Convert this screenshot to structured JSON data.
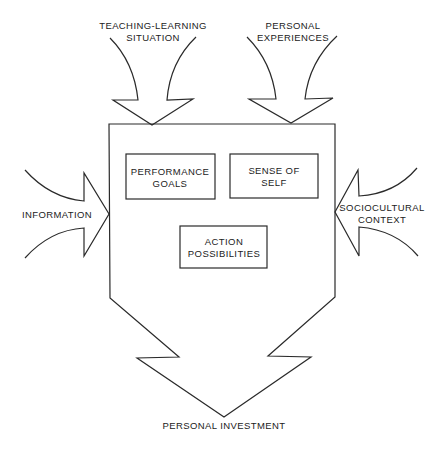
{
  "diagram": {
    "type": "flow-influence-diagram",
    "inputs": {
      "top_left": {
        "lines": [
          "TEACHING-LEARNING",
          "SITUATION"
        ]
      },
      "top_right": {
        "lines": [
          "PERSONAL",
          "EXPERIENCES"
        ]
      },
      "left": {
        "lines": [
          "INFORMATION"
        ]
      },
      "right": {
        "lines": [
          "SOCIOCULTURAL",
          "CONTEXT"
        ]
      }
    },
    "inner_boxes": {
      "performance_goals": {
        "lines": [
          "PERFORMANCE",
          "GOALS"
        ]
      },
      "sense_of_self": {
        "lines": [
          "SENSE OF",
          "SELF"
        ]
      },
      "action_possibilities": {
        "lines": [
          "ACTION",
          "POSSIBILITIES"
        ]
      }
    },
    "output": {
      "lines": [
        "PERSONAL INVESTMENT"
      ]
    },
    "colors": {
      "stroke": "#2a2a2a",
      "text": "#222222",
      "background": "#ffffff"
    }
  }
}
